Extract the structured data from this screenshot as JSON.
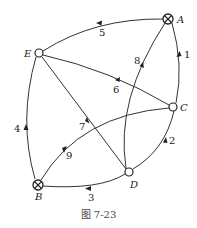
{
  "figure": {
    "caption": "图 7-23"
  },
  "nodes": {
    "A": {
      "label": "A",
      "type": "source-sink-crossed"
    },
    "B": {
      "label": "B",
      "type": "source-sink-crossed"
    },
    "C": {
      "label": "C",
      "type": "open"
    },
    "D": {
      "label": "D",
      "type": "open"
    },
    "E": {
      "label": "E",
      "type": "open"
    }
  },
  "edges": [
    {
      "id": "1",
      "label": "1",
      "from": "A",
      "to": "C"
    },
    {
      "id": "2",
      "label": "2",
      "from": "D",
      "to": "C"
    },
    {
      "id": "3",
      "label": "3",
      "from": "D",
      "to": "B"
    },
    {
      "id": "4",
      "label": "4",
      "from": "B",
      "to": "E"
    },
    {
      "id": "5",
      "label": "5",
      "from": "A",
      "to": "E"
    },
    {
      "id": "6",
      "label": "6",
      "from": "C",
      "to": "E"
    },
    {
      "id": "7",
      "label": "7",
      "from": "D",
      "to": "E"
    },
    {
      "id": "8",
      "label": "8",
      "from": "D",
      "to": "A"
    },
    {
      "id": "9",
      "label": "9",
      "from": "B",
      "to": "C"
    }
  ],
  "colors": {
    "stroke": "#222222",
    "background": "#ffffff"
  }
}
